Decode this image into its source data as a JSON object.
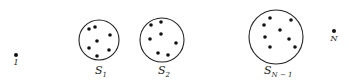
{
  "diagram": {
    "colors": {
      "stroke": "#222222",
      "dot": "#111111",
      "background": "#ffffff"
    },
    "singletons": [
      {
        "id": "1",
        "label": "1",
        "x": 16,
        "y": 55,
        "label_y": 65
      },
      {
        "id": "N",
        "label": "N",
        "x": 334,
        "y": 31,
        "label_y": 41
      }
    ],
    "sets": [
      {
        "id": "S1",
        "label_main": "S",
        "label_sub": "1",
        "cx": 99,
        "cy": 40,
        "r": 20,
        "label_x": 95,
        "label_y": 74,
        "points": [
          [
            89,
            29
          ],
          [
            95,
            27
          ],
          [
            110,
            35
          ],
          [
            97,
            41
          ],
          [
            89,
            48
          ],
          [
            109,
            50
          ],
          [
            97,
            56
          ]
        ]
      },
      {
        "id": "S2",
        "label_main": "S",
        "label_sub": "2",
        "cx": 162,
        "cy": 40,
        "r": 22,
        "label_x": 158,
        "label_y": 74,
        "points": [
          [
            151,
            25
          ],
          [
            161,
            22
          ],
          [
            161,
            34
          ],
          [
            150,
            39
          ],
          [
            176,
            43
          ],
          [
            158,
            53
          ],
          [
            168,
            55
          ]
        ]
      },
      {
        "id": "SN-1",
        "label_main": "S",
        "label_sub": "N − 1",
        "cx": 276,
        "cy": 37,
        "r": 27,
        "label_x": 264,
        "label_y": 74,
        "points": [
          [
            270,
            18
          ],
          [
            291,
            20
          ],
          [
            264,
            25
          ],
          [
            280,
            30
          ],
          [
            265,
            37
          ],
          [
            289,
            39
          ],
          [
            270,
            47
          ],
          [
            295,
            47
          ]
        ]
      }
    ]
  }
}
